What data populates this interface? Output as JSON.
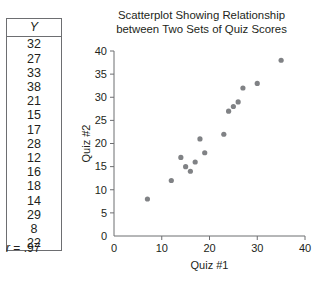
{
  "table": {
    "header": "Y",
    "values": [
      32,
      27,
      33,
      38,
      21,
      15,
      17,
      28,
      12,
      16,
      18,
      14,
      29,
      8,
      22
    ]
  },
  "correlation": {
    "symbol": "r",
    "text": " = .97"
  },
  "chart_data": {
    "type": "scatter",
    "title": "Scatterplot Showing Relationship between Two Sets of Quiz Scores",
    "title_line1": "Scatterplot Showing Relationship",
    "title_line2": "between Two Sets of Quiz Scores",
    "xlabel": "Quiz #1",
    "ylabel": "Quiz #2",
    "xlim": [
      0,
      40
    ],
    "ylim": [
      0,
      40
    ],
    "xticks": [
      0,
      10,
      20,
      30,
      40
    ],
    "yticks": [
      0,
      5,
      10,
      15,
      20,
      25,
      30,
      35,
      40
    ],
    "grid": false,
    "legend": null,
    "marker_color": "#808285",
    "axis_color": "#6d6e71",
    "x": [
      7,
      12,
      14,
      15,
      16,
      17,
      18,
      19,
      23,
      24,
      25,
      26,
      27,
      30,
      35
    ],
    "y": [
      8,
      12,
      17,
      15,
      14,
      16,
      21,
      18,
      22,
      27,
      28,
      29,
      32,
      33,
      38
    ],
    "points": [
      {
        "x": 7,
        "y": 8
      },
      {
        "x": 12,
        "y": 12
      },
      {
        "x": 14,
        "y": 17
      },
      {
        "x": 15,
        "y": 15
      },
      {
        "x": 16,
        "y": 14
      },
      {
        "x": 17,
        "y": 16
      },
      {
        "x": 18,
        "y": 21
      },
      {
        "x": 19,
        "y": 18
      },
      {
        "x": 23,
        "y": 22
      },
      {
        "x": 24,
        "y": 27
      },
      {
        "x": 25,
        "y": 28
      },
      {
        "x": 26,
        "y": 29
      },
      {
        "x": 27,
        "y": 32
      },
      {
        "x": 30,
        "y": 33
      },
      {
        "x": 35,
        "y": 38
      }
    ],
    "annotations": [
      "r = .97"
    ]
  }
}
